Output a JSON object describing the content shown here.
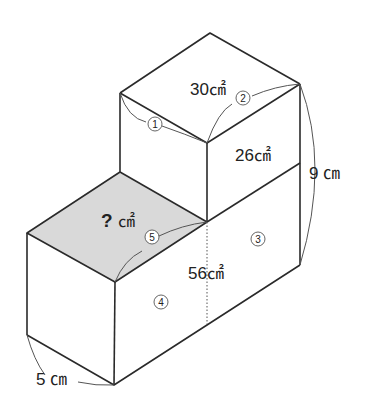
{
  "diagram": {
    "type": "isometric-solid",
    "labels": {
      "top_face_area": "30㎠",
      "upper_front_right_area": "26㎠",
      "lower_front_right_area": "56㎠",
      "unknown_area_q": "?",
      "unknown_area_unit": "㎠",
      "height": "9 ㎝",
      "depth": "5 ㎝"
    },
    "markers": {
      "m1": "1",
      "m2": "2",
      "m3": "3",
      "m4": "4",
      "m5": "5"
    },
    "colors": {
      "line": "#2a2a2a",
      "shade": "#d9d9d9"
    }
  }
}
